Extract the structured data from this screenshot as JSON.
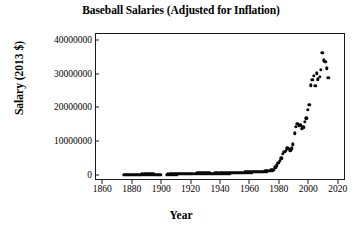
{
  "chart_data": {
    "type": "scatter",
    "title": "Baseball Salaries (Adjusted for Inflation)",
    "xlabel": "Year",
    "ylabel": "Salary (2013 $)",
    "xlim": [
      1855,
      2025
    ],
    "ylim": [
      -1500000,
      42000000
    ],
    "grid": false,
    "legend": null,
    "xticks": [
      1860,
      1880,
      1900,
      1920,
      1940,
      1960,
      1980,
      2000,
      2020
    ],
    "xtick_labels": [
      "1860",
      "1880",
      "1900",
      "1920",
      "1940",
      "1960",
      "1980",
      "2000",
      "2020"
    ],
    "yticks": [
      0,
      10000000,
      20000000,
      30000000,
      40000000
    ],
    "ytick_labels": [
      "0",
      "10000000",
      "20000000",
      "30000000",
      "40000000"
    ],
    "marker": "filled-circle",
    "marker_color": "#0a0a0a",
    "points": [
      [
        1874,
        300000
      ],
      [
        1875,
        320000
      ],
      [
        1876,
        340000
      ],
      [
        1877,
        330000
      ],
      [
        1878,
        350000
      ],
      [
        1879,
        360000
      ],
      [
        1880,
        370000
      ],
      [
        1881,
        380000
      ],
      [
        1882,
        390000
      ],
      [
        1883,
        400000
      ],
      [
        1884,
        410000
      ],
      [
        1885,
        420000
      ],
      [
        1886,
        430000
      ],
      [
        1887,
        440000
      ],
      [
        1888,
        450000
      ],
      [
        1889,
        460000
      ],
      [
        1890,
        470000
      ],
      [
        1891,
        460000
      ],
      [
        1892,
        450000
      ],
      [
        1893,
        440000
      ],
      [
        1894,
        430000
      ],
      [
        1895,
        420000
      ],
      [
        1896,
        410000
      ],
      [
        1897,
        400000
      ],
      [
        1898,
        390000
      ],
      [
        1899,
        380000
      ],
      [
        1903,
        420000
      ],
      [
        1904,
        430000
      ],
      [
        1905,
        440000
      ],
      [
        1906,
        450000
      ],
      [
        1907,
        460000
      ],
      [
        1908,
        470000
      ],
      [
        1909,
        490000
      ],
      [
        1910,
        520000
      ],
      [
        1911,
        540000
      ],
      [
        1912,
        560000
      ],
      [
        1913,
        580000
      ],
      [
        1914,
        620000
      ],
      [
        1915,
        640000
      ],
      [
        1916,
        620000
      ],
      [
        1917,
        600000
      ],
      [
        1918,
        560000
      ],
      [
        1919,
        580000
      ],
      [
        1920,
        640000
      ],
      [
        1921,
        660000
      ],
      [
        1922,
        680000
      ],
      [
        1923,
        700000
      ],
      [
        1924,
        720000
      ],
      [
        1925,
        740000
      ],
      [
        1926,
        760000
      ],
      [
        1927,
        780000
      ],
      [
        1928,
        790000
      ],
      [
        1929,
        800000
      ],
      [
        1930,
        820000
      ],
      [
        1931,
        800000
      ],
      [
        1932,
        760000
      ],
      [
        1933,
        700000
      ],
      [
        1934,
        690000
      ],
      [
        1935,
        700000
      ],
      [
        1936,
        720000
      ],
      [
        1937,
        740000
      ],
      [
        1938,
        750000
      ],
      [
        1939,
        760000
      ],
      [
        1940,
        770000
      ],
      [
        1941,
        780000
      ],
      [
        1942,
        760000
      ],
      [
        1943,
        740000
      ],
      [
        1944,
        730000
      ],
      [
        1945,
        740000
      ],
      [
        1946,
        800000
      ],
      [
        1947,
        860000
      ],
      [
        1948,
        900000
      ],
      [
        1949,
        920000
      ],
      [
        1950,
        940000
      ],
      [
        1951,
        950000
      ],
      [
        1952,
        960000
      ],
      [
        1953,
        970000
      ],
      [
        1954,
        980000
      ],
      [
        1955,
        1000000
      ],
      [
        1956,
        1020000
      ],
      [
        1957,
        1040000
      ],
      [
        1958,
        1060000
      ],
      [
        1959,
        1080000
      ],
      [
        1960,
        1100000
      ],
      [
        1961,
        1120000
      ],
      [
        1962,
        1140000
      ],
      [
        1963,
        1150000
      ],
      [
        1964,
        1170000
      ],
      [
        1965,
        1190000
      ],
      [
        1966,
        1210000
      ],
      [
        1967,
        1230000
      ],
      [
        1968,
        1250000
      ],
      [
        1969,
        1300000
      ],
      [
        1970,
        1380000
      ],
      [
        1971,
        1420000
      ],
      [
        1972,
        1480000
      ],
      [
        1973,
        1560000
      ],
      [
        1974,
        1640000
      ],
      [
        1975,
        1720000
      ],
      [
        1976,
        1900000
      ],
      [
        1977,
        2600000
      ],
      [
        1978,
        3200000
      ],
      [
        1979,
        3800000
      ],
      [
        1980,
        4400000
      ],
      [
        1981,
        5200000
      ],
      [
        1982,
        6600000
      ],
      [
        1983,
        7200000
      ],
      [
        1984,
        7400000
      ],
      [
        1985,
        8200000
      ],
      [
        1986,
        8000000
      ],
      [
        1987,
        7600000
      ],
      [
        1988,
        8200000
      ],
      [
        1989,
        9400000
      ],
      [
        1990,
        12600000
      ],
      [
        1991,
        14600000
      ],
      [
        1992,
        15400000
      ],
      [
        1993,
        14800000
      ],
      [
        1994,
        15000000
      ],
      [
        1995,
        14000000
      ],
      [
        1996,
        14400000
      ],
      [
        1997,
        16000000
      ],
      [
        1998,
        17000000
      ],
      [
        1999,
        19600000
      ],
      [
        2000,
        21000000
      ],
      [
        2001,
        26800000
      ],
      [
        2002,
        28400000
      ],
      [
        2003,
        29600000
      ],
      [
        2004,
        26600000
      ],
      [
        2005,
        30400000
      ],
      [
        2006,
        28600000
      ],
      [
        2007,
        29400000
      ],
      [
        2008,
        31400000
      ],
      [
        2009,
        36400000
      ],
      [
        2010,
        34200000
      ],
      [
        2011,
        33800000
      ],
      [
        2012,
        31800000
      ],
      [
        2013,
        29000000
      ]
    ]
  }
}
